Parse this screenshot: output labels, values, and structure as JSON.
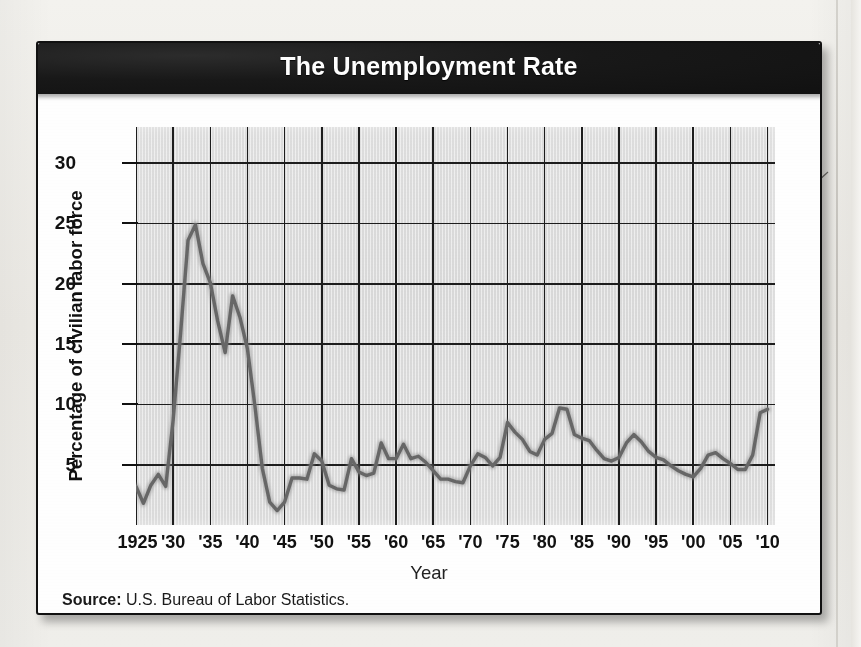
{
  "figure": {
    "title": "The Unemployment Rate",
    "source_label": "Source:",
    "source_text": " U.S. Bureau of Labor Statistics.",
    "accent_header_color": "#141414",
    "plot_background_color": "#dadada",
    "line_color": "#6a6a6a"
  },
  "chart_data": {
    "type": "line",
    "title": "The Unemployment Rate",
    "subtitle": "",
    "xlabel": "Year",
    "ylabel": "Percentage of civilian labor force",
    "xlim": [
      1925,
      2011
    ],
    "ylim": [
      0,
      33
    ],
    "grid": true,
    "legend": null,
    "y_ticks": [
      5,
      10,
      15,
      20,
      25,
      30
    ],
    "x_ticks": [
      1925,
      1930,
      1935,
      1940,
      1945,
      1950,
      1955,
      1960,
      1965,
      1970,
      1975,
      1980,
      1985,
      1990,
      1995,
      2000,
      2005,
      2010
    ],
    "x_tick_labels": [
      "1925",
      "'30",
      "'35",
      "'40",
      "'45",
      "'50",
      "'55",
      "'60",
      "'65",
      "'70",
      "'75",
      "'80",
      "'85",
      "'90",
      "'95",
      "'00",
      "'05",
      "'10"
    ],
    "series": [
      {
        "name": "Unemployment rate",
        "color": "#6a6a6a",
        "x": [
          1925,
          1926,
          1927,
          1928,
          1929,
          1930,
          1931,
          1932,
          1933,
          1934,
          1935,
          1936,
          1937,
          1938,
          1939,
          1940,
          1941,
          1942,
          1943,
          1944,
          1945,
          1946,
          1947,
          1948,
          1949,
          1950,
          1951,
          1952,
          1953,
          1954,
          1955,
          1956,
          1957,
          1958,
          1959,
          1960,
          1961,
          1962,
          1963,
          1964,
          1965,
          1966,
          1967,
          1968,
          1969,
          1970,
          1971,
          1972,
          1973,
          1974,
          1975,
          1976,
          1977,
          1978,
          1979,
          1980,
          1981,
          1982,
          1983,
          1984,
          1985,
          1986,
          1987,
          1988,
          1989,
          1990,
          1991,
          1992,
          1993,
          1994,
          1995,
          1996,
          1997,
          1998,
          1999,
          2000,
          2001,
          2002,
          2003,
          2004,
          2005,
          2006,
          2007,
          2008,
          2009,
          2010
        ],
        "values": [
          3.2,
          1.8,
          3.3,
          4.2,
          3.2,
          8.7,
          15.9,
          23.6,
          24.9,
          21.7,
          20.1,
          16.9,
          14.3,
          19.0,
          17.2,
          14.6,
          9.9,
          4.7,
          1.9,
          1.2,
          1.9,
          3.9,
          3.9,
          3.8,
          5.9,
          5.3,
          3.3,
          3.0,
          2.9,
          5.5,
          4.4,
          4.1,
          4.3,
          6.8,
          5.5,
          5.5,
          6.7,
          5.5,
          5.7,
          5.2,
          4.5,
          3.8,
          3.8,
          3.6,
          3.5,
          4.9,
          5.9,
          5.6,
          4.9,
          5.6,
          8.5,
          7.7,
          7.1,
          6.1,
          5.8,
          7.1,
          7.6,
          9.7,
          9.6,
          7.5,
          7.2,
          7.0,
          6.2,
          5.5,
          5.3,
          5.6,
          6.8,
          7.5,
          6.9,
          6.1,
          5.6,
          5.4,
          4.9,
          4.5,
          4.2,
          4.0,
          4.7,
          5.8,
          6.0,
          5.5,
          5.1,
          4.6,
          4.6,
          5.8,
          9.3,
          9.6
        ]
      }
    ],
    "annotations": [],
    "source": "Source: U.S. Bureau of Labor Statistics."
  }
}
